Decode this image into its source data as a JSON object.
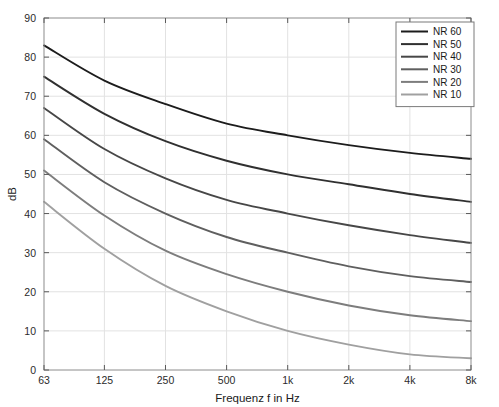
{
  "chart_data": {
    "type": "line",
    "title": "",
    "xlabel": "Frequenz f in Hz",
    "ylabel": "dB",
    "x_tick_labels": [
      "63",
      "125",
      "250",
      "500",
      "1k",
      "2k",
      "4k",
      "8k"
    ],
    "x_values": [
      63,
      125,
      250,
      500,
      1000,
      2000,
      4000,
      8000
    ],
    "x_scale": "log",
    "xlim": [
      63,
      8000
    ],
    "y_tick_labels": [
      "0",
      "10",
      "20",
      "30",
      "40",
      "50",
      "60",
      "70",
      "80",
      "90"
    ],
    "y_ticks": [
      0,
      10,
      20,
      30,
      40,
      50,
      60,
      70,
      80,
      90
    ],
    "ylim": [
      0,
      90
    ],
    "grid": true,
    "legend_position": "top-right",
    "series": [
      {
        "name": "NR 60",
        "color": "#1c1c1c",
        "values": [
          83,
          74,
          68,
          63,
          60,
          57.5,
          55.5,
          54
        ]
      },
      {
        "name": "NR 50",
        "color": "#303030",
        "values": [
          75,
          65.5,
          58.5,
          53.5,
          50,
          47.5,
          45,
          43
        ]
      },
      {
        "name": "NR 40",
        "color": "#474747",
        "values": [
          67,
          56.5,
          49,
          43.5,
          40,
          37,
          34.5,
          32.5
        ]
      },
      {
        "name": "NR 30",
        "color": "#5f5f5f",
        "values": [
          59,
          48,
          40,
          34,
          30,
          26.5,
          24,
          22.5
        ]
      },
      {
        "name": "NR 20",
        "color": "#7d7d7d",
        "values": [
          51,
          39.5,
          30.5,
          24.5,
          20,
          16.5,
          14,
          12.5
        ]
      },
      {
        "name": "NR 10",
        "color": "#a0a0a0",
        "values": [
          43,
          31,
          21.5,
          15,
          10,
          6.5,
          4,
          3
        ]
      }
    ]
  },
  "legend": {
    "entries": [
      "NR 60",
      "NR 50",
      "NR 40",
      "NR 30",
      "NR 20",
      "NR 10"
    ]
  },
  "axes": {
    "x_label": "Frequenz f in Hz",
    "y_label": "dB"
  }
}
